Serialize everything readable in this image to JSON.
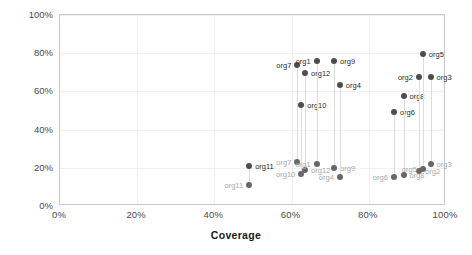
{
  "chart_data": {
    "type": "scatter",
    "title": "",
    "xlabel": "Coverage",
    "ylabel": "Efficiency",
    "xlim": [
      0,
      100
    ],
    "ylim": [
      0,
      100
    ],
    "xticks": [
      "0%",
      "20%",
      "40%",
      "60%",
      "80%",
      "100%"
    ],
    "xtick_values": [
      0,
      20,
      40,
      60,
      80,
      100
    ],
    "yticks": [
      "0%",
      "20%",
      "40%",
      "60%",
      "80%",
      "100%"
    ],
    "ytick_values": [
      0,
      20,
      40,
      60,
      80,
      100
    ],
    "grid": true,
    "legend": "none",
    "series": [
      {
        "name": "Efficiency",
        "point_color": "#4d4d4d",
        "label_color": "#2b2b2b"
      },
      {
        "name": "Lower metric",
        "point_color": "#666666",
        "label_color": "#a9a9a9"
      }
    ],
    "points": [
      {
        "label": "org11",
        "x": 49.0,
        "y": 21.0,
        "y2": 11.0,
        "label_side": "right",
        "label2_side": "left"
      },
      {
        "label": "org7",
        "x": 61.5,
        "y": 74.0,
        "y2": 23.0,
        "label_side": "left",
        "label2_side": "left"
      },
      {
        "label": "org10",
        "x": 62.5,
        "y": 53.0,
        "y2": 17.0,
        "label_side": "right",
        "label2_side": "left"
      },
      {
        "label": "org12",
        "x": 63.5,
        "y": 69.5,
        "y2": 19.0,
        "label_side": "right",
        "label2_side": "right"
      },
      {
        "label": "org1",
        "x": 66.5,
        "y": 76.0,
        "y2": 22.0,
        "label_side": "left",
        "label2_side": "left"
      },
      {
        "label": "org9",
        "x": 71.0,
        "y": 76.0,
        "y2": 20.0,
        "label_side": "right",
        "label2_side": "right"
      },
      {
        "label": "org4",
        "x": 72.5,
        "y": 63.5,
        "y2": 15.0,
        "label_side": "right",
        "label2_side": "left"
      },
      {
        "label": "org6",
        "x": 86.5,
        "y": 49.0,
        "y2": 15.0,
        "label_side": "right",
        "label2_side": "left"
      },
      {
        "label": "org8",
        "x": 89.0,
        "y": 57.5,
        "y2": 16.0,
        "label_side": "right",
        "label2_side": "right"
      },
      {
        "label": "org2",
        "x": 93.0,
        "y": 67.5,
        "y2": 18.5,
        "label_side": "left",
        "label2_side": "right"
      },
      {
        "label": "org5",
        "x": 94.0,
        "y": 79.5,
        "y2": 19.5,
        "label_side": "right",
        "label2_side": "left"
      },
      {
        "label": "org3",
        "x": 96.0,
        "y": 67.5,
        "y2": 22.0,
        "label_side": "right",
        "label2_side": "right"
      }
    ]
  }
}
